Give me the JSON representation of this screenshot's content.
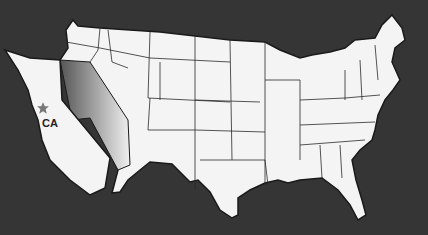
{
  "map": {
    "title": "United States map with California highlighted",
    "highlighted_state": "CA",
    "label": "CA",
    "marker": "star-icon",
    "colors": {
      "background": "#353535",
      "land": "#f4f4f4",
      "border": "#1a1a1a",
      "star": "#777777",
      "shade": "#6a6a6a"
    }
  }
}
